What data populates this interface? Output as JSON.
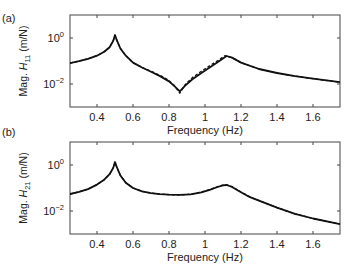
{
  "chart_data": [
    {
      "type": "line",
      "panel_label": "(a)",
      "title": "",
      "xlabel": "Frequency (Hz)",
      "ylabel_prefix": "Mag. ",
      "ylabel_var": "H",
      "ylabel_sub": "11",
      "ylabel_suffix": " (m/N)",
      "yscale": "log",
      "xlim": [
        0.25,
        1.75
      ],
      "ylim": [
        0.001,
        10
      ],
      "xticks": [
        0.4,
        0.6,
        0.8,
        1.0,
        1.2,
        1.4,
        1.6
      ],
      "xtick_labels": [
        "0.4",
        "0.6",
        "0.8",
        "1",
        "1.2",
        "1.4",
        "1.6"
      ],
      "yticks": [
        1,
        0.01
      ],
      "ytick_labels": [
        {
          "base": "10",
          "exp": "0"
        },
        {
          "base": "10",
          "exp": "−2"
        }
      ],
      "grid": false,
      "legend": null,
      "series": [
        {
          "name": "solid",
          "style": "solid",
          "x": [
            0.25,
            0.3,
            0.35,
            0.4,
            0.44,
            0.47,
            0.49,
            0.5,
            0.51,
            0.53,
            0.56,
            0.6,
            0.65,
            0.7,
            0.75,
            0.8,
            0.83,
            0.86,
            0.89,
            0.93,
            0.98,
            1.03,
            1.08,
            1.12,
            1.15,
            1.2,
            1.3,
            1.4,
            1.5,
            1.6,
            1.75
          ],
          "y": [
            0.081,
            0.098,
            0.125,
            0.17,
            0.25,
            0.4,
            0.75,
            1.35,
            0.8,
            0.35,
            0.17,
            0.085,
            0.052,
            0.034,
            0.022,
            0.013,
            0.008,
            0.0048,
            0.0085,
            0.016,
            0.03,
            0.055,
            0.1,
            0.165,
            0.14,
            0.085,
            0.045,
            0.03,
            0.022,
            0.017,
            0.012
          ]
        },
        {
          "name": "dashed",
          "style": "dashed",
          "x": [
            0.25,
            0.3,
            0.35,
            0.4,
            0.44,
            0.47,
            0.49,
            0.5,
            0.51,
            0.53,
            0.56,
            0.6,
            0.65,
            0.7,
            0.75,
            0.8,
            0.83,
            0.86,
            0.89,
            0.93,
            0.98,
            1.03,
            1.08,
            1.11,
            1.15,
            1.2,
            1.3,
            1.4,
            1.5,
            1.6,
            1.75
          ],
          "y": [
            0.081,
            0.098,
            0.125,
            0.17,
            0.25,
            0.4,
            0.75,
            1.3,
            0.8,
            0.35,
            0.17,
            0.085,
            0.052,
            0.036,
            0.024,
            0.014,
            0.0085,
            0.004,
            0.0095,
            0.019,
            0.036,
            0.065,
            0.115,
            0.17,
            0.14,
            0.085,
            0.045,
            0.03,
            0.022,
            0.017,
            0.012
          ]
        }
      ]
    },
    {
      "type": "line",
      "panel_label": "(b)",
      "title": "",
      "xlabel": "Frequency (Hz)",
      "ylabel_prefix": "Mag. ",
      "ylabel_var": "H",
      "ylabel_sub": "21",
      "ylabel_suffix": " (m/N)",
      "yscale": "log",
      "xlim": [
        0.25,
        1.75
      ],
      "ylim": [
        0.001,
        10
      ],
      "xticks": [
        0.4,
        0.6,
        0.8,
        1.0,
        1.2,
        1.4,
        1.6
      ],
      "xtick_labels": [
        "0.4",
        "0.6",
        "0.8",
        "1",
        "1.2",
        "1.4",
        "1.6"
      ],
      "yticks": [
        1,
        0.01
      ],
      "ytick_labels": [
        {
          "base": "10",
          "exp": "0"
        },
        {
          "base": "10",
          "exp": "−2"
        }
      ],
      "grid": false,
      "legend": null,
      "series": [
        {
          "name": "solid",
          "style": "solid",
          "x": [
            0.25,
            0.3,
            0.35,
            0.4,
            0.44,
            0.47,
            0.49,
            0.5,
            0.51,
            0.53,
            0.56,
            0.6,
            0.65,
            0.7,
            0.75,
            0.8,
            0.86,
            0.92,
            0.98,
            1.03,
            1.07,
            1.1,
            1.12,
            1.15,
            1.2,
            1.25,
            1.3,
            1.4,
            1.5,
            1.6,
            1.75
          ],
          "y": [
            0.055,
            0.068,
            0.09,
            0.14,
            0.23,
            0.4,
            0.75,
            1.35,
            0.8,
            0.35,
            0.17,
            0.1,
            0.072,
            0.06,
            0.054,
            0.051,
            0.05,
            0.053,
            0.065,
            0.085,
            0.11,
            0.13,
            0.135,
            0.11,
            0.065,
            0.04,
            0.028,
            0.014,
            0.0075,
            0.0047,
            0.0027
          ]
        },
        {
          "name": "dashed",
          "style": "dashed",
          "x": [
            0.25,
            0.3,
            0.35,
            0.4,
            0.44,
            0.47,
            0.49,
            0.5,
            0.51,
            0.53,
            0.56,
            0.6,
            0.65,
            0.7,
            0.75,
            0.8,
            0.86,
            0.92,
            0.98,
            1.03,
            1.07,
            1.1,
            1.12,
            1.15,
            1.2,
            1.25,
            1.3,
            1.4,
            1.5,
            1.6,
            1.75
          ],
          "y": [
            0.055,
            0.068,
            0.09,
            0.14,
            0.23,
            0.4,
            0.75,
            1.3,
            0.8,
            0.35,
            0.17,
            0.1,
            0.072,
            0.06,
            0.054,
            0.051,
            0.05,
            0.054,
            0.067,
            0.088,
            0.115,
            0.135,
            0.14,
            0.115,
            0.067,
            0.041,
            0.028,
            0.014,
            0.0075,
            0.0047,
            0.0027
          ]
        }
      ]
    }
  ],
  "layout": {
    "panels": [
      {
        "left": 70,
        "top": 15,
        "right": 340,
        "bottom": 107,
        "label_x": 2,
        "label_y": 22,
        "ylabel_x": 27
      },
      {
        "left": 70,
        "top": 142,
        "right": 340,
        "bottom": 234,
        "label_x": 2,
        "label_y": 136,
        "ylabel_x": 27
      }
    ],
    "line_color": "#111111",
    "axis_color": "#444444"
  }
}
